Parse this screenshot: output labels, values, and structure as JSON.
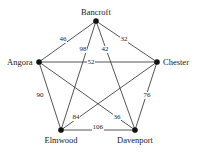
{
  "figure": {
    "name": "complete-graph-five-cities",
    "background_color": "#ffffff",
    "edge_color": "#2b2b2b",
    "vertex_color": "#111111",
    "text_color": "#1a1a1a"
  },
  "chart_data": {
    "type": "diagram",
    "title": "",
    "xlabel": "",
    "ylabel": "",
    "graph_kind": "complete-weighted-graph",
    "vertex_count": 5,
    "edge_count": 10,
    "nodes": [
      {
        "id": "bancroft",
        "label": "Bancroft",
        "x": 96,
        "y": 21
      },
      {
        "id": "angora",
        "label": "Angora",
        "x": 39,
        "y": 62
      },
      {
        "id": "chester",
        "label": "Chester",
        "x": 157,
        "y": 62
      },
      {
        "id": "elmwood",
        "label": "Elmwood",
        "x": 61,
        "y": 130
      },
      {
        "id": "davenport",
        "label": "Davenport",
        "x": 135,
        "y": 130
      }
    ],
    "edges": [
      {
        "from": "bancroft",
        "to": "angora",
        "weight": "46",
        "lx": 63,
        "ly": 39
      },
      {
        "from": "bancroft",
        "to": "chester",
        "weight": "32",
        "lx": 124,
        "ly": 39
      },
      {
        "from": "bancroft",
        "to": "elmwood",
        "weight": "98",
        "lx": 83,
        "ly": 49
      },
      {
        "from": "bancroft",
        "to": "davenport",
        "weight": "42",
        "lx": 105,
        "ly": 49
      },
      {
        "from": "angora",
        "to": "chester",
        "weight": "52",
        "lx": 91,
        "ly": 62
      },
      {
        "from": "angora",
        "to": "elmwood",
        "weight": "90",
        "lx": 40,
        "ly": 95
      },
      {
        "from": "angora",
        "to": "davenport",
        "weight": "84",
        "lx": 76,
        "ly": 117
      },
      {
        "from": "chester",
        "to": "davenport",
        "weight": "76",
        "lx": 147,
        "ly": 95
      },
      {
        "from": "chester",
        "to": "elmwood",
        "weight": "36",
        "lx": 117,
        "ly": 117
      },
      {
        "from": "elmwood",
        "to": "davenport",
        "weight": "106",
        "lx": 98,
        "ly": 127
      }
    ],
    "legend": [],
    "annotations": []
  }
}
